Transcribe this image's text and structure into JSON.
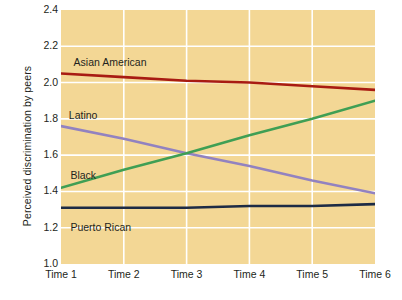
{
  "chart_data": {
    "type": "line",
    "title": "",
    "xlabel": "",
    "ylabel": "Perceived discrimination by peers",
    "categories": [
      "Time 1",
      "Time 2",
      "Time 3",
      "Time 4",
      "Time 5",
      "Time 6"
    ],
    "ylim": [
      1.0,
      2.4
    ],
    "yticks": [
      "2.4",
      "2.2",
      "2.0",
      "1.8",
      "1.6",
      "1.4",
      "1.2",
      "1.0"
    ],
    "ytick_values": [
      2.4,
      2.2,
      2.0,
      1.8,
      1.6,
      1.4,
      1.2,
      1.0
    ],
    "grid": true,
    "grid_color": "#ffffff",
    "plot_background": "#f3d795",
    "legend": "inline-labels",
    "series": [
      {
        "name": "Asian American",
        "color": "#a81b12",
        "values": [
          2.05,
          2.03,
          2.01,
          2.0,
          1.98,
          1.96
        ],
        "label_x_pct": 4.0,
        "label_y_pct": 18.5
      },
      {
        "name": "Latino",
        "color": "#9282c0",
        "values": [
          1.76,
          1.69,
          1.61,
          1.54,
          1.46,
          1.39
        ],
        "label_x_pct": 2.5,
        "label_y_pct": 39.5
      },
      {
        "name": "Black",
        "color": "#3f9f54",
        "values": [
          1.42,
          1.52,
          1.61,
          1.71,
          1.8,
          1.9
        ],
        "label_x_pct": 3.0,
        "label_y_pct": 63.0
      },
      {
        "name": "Puerto Rican",
        "color": "#1d2b45",
        "values": [
          1.31,
          1.31,
          1.31,
          1.32,
          1.32,
          1.33
        ],
        "label_x_pct": 3.0,
        "label_y_pct": 83.5
      }
    ]
  }
}
